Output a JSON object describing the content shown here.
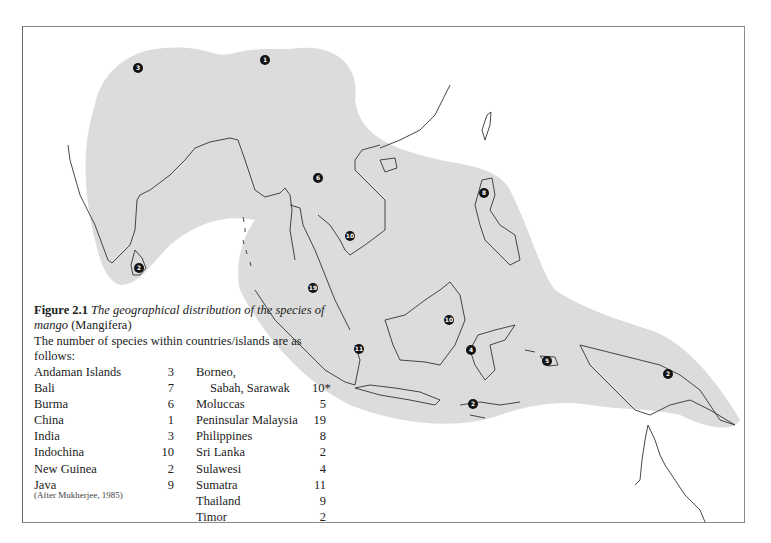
{
  "figure": {
    "number": "Figure 2.1",
    "title_italic": "The geographical distribution of the species of mango",
    "genus": "(Mangifera)",
    "intro": "The number of species within countries/islands are as follows:",
    "source": "(After Mukherjee, 1985)"
  },
  "table_left": [
    {
      "name": "Andaman Islands",
      "value": "3"
    },
    {
      "name": "Bali",
      "value": "7"
    },
    {
      "name": "Burma",
      "value": "6"
    },
    {
      "name": "China",
      "value": "1"
    },
    {
      "name": "India",
      "value": "3"
    },
    {
      "name": "Indochina",
      "value": "10"
    },
    {
      "name": "New Guinea",
      "value": "2"
    },
    {
      "name": "Java",
      "value": "9"
    }
  ],
  "table_right": [
    {
      "name": "Borneo,",
      "value": ""
    },
    {
      "name": "Sabah, Sarawak",
      "value": "10*"
    },
    {
      "name": "Moluccas",
      "value": "5"
    },
    {
      "name": "Peninsular Malaysia",
      "value": "19"
    },
    {
      "name": "Philippines",
      "value": "8"
    },
    {
      "name": "Sri Lanka",
      "value": "2"
    },
    {
      "name": "Sulawesi",
      "value": "4"
    },
    {
      "name": "Sumatra",
      "value": "11"
    },
    {
      "name": "Thailand",
      "value": "9"
    },
    {
      "name": "Timor",
      "value": "2"
    }
  ],
  "markers": [
    {
      "label": "3",
      "region": "andaman",
      "x": 138,
      "y": 68
    },
    {
      "label": "1",
      "region": "china",
      "x": 265,
      "y": 60
    },
    {
      "label": "2",
      "region": "sri-lanka",
      "x": 139,
      "y": 268
    },
    {
      "label": "6",
      "region": "burma",
      "x": 318,
      "y": 178
    },
    {
      "label": "10",
      "region": "indochina",
      "x": 350,
      "y": 236
    },
    {
      "label": "8",
      "region": "philippines",
      "x": 484,
      "y": 193
    },
    {
      "label": "19",
      "region": "peninsular-malaysia",
      "x": 313,
      "y": 288
    },
    {
      "label": "11",
      "region": "sumatra",
      "x": 359,
      "y": 349
    },
    {
      "label": "10",
      "region": "borneo",
      "x": 449,
      "y": 320
    },
    {
      "label": "4",
      "region": "sulawesi",
      "x": 471,
      "y": 350
    },
    {
      "label": "2",
      "region": "timor",
      "x": 473,
      "y": 404
    },
    {
      "label": "5",
      "region": "moluccas",
      "x": 547,
      "y": 361
    },
    {
      "label": "2",
      "region": "new-guinea",
      "x": 668,
      "y": 374
    }
  ],
  "colors": {
    "distribution_fill": "#dcdcdc",
    "coastline": "#333333",
    "marker": "#111111"
  }
}
